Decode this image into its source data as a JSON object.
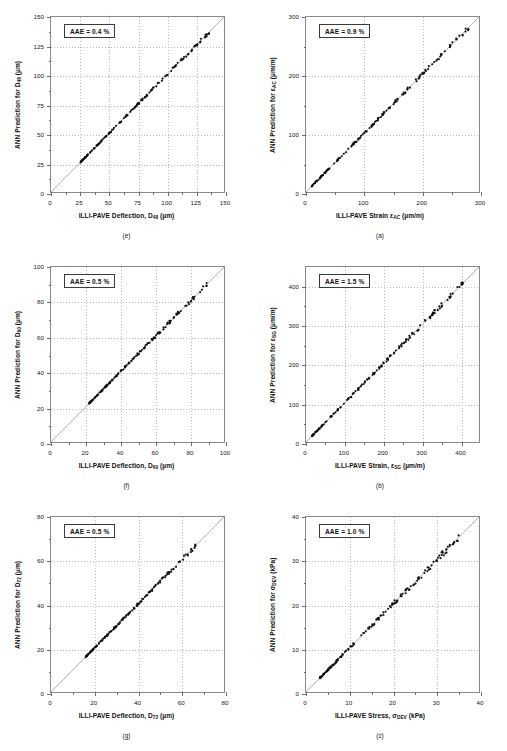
{
  "figure": {
    "background": "#ffffff",
    "point_color": "#111111",
    "grid_color": "#bdbdbd",
    "frame_color": "#8a8a8a"
  },
  "chart_data": [
    {
      "id": "panel-e",
      "type": "scatter",
      "caption": "(e)",
      "annotation": "AAE = 0.4 %",
      "xlabel_html": "ILLI-PAVE Deflection, D<sub>48</sub> (µm)",
      "ylabel_html": "ANN Prediction for D<sub>48</sub> (µm)",
      "xlabel": "ILLI-PAVE Deflection, D48 (µm)",
      "ylabel": "ANN Prediction for D48 (µm)",
      "xlim": [
        0,
        150
      ],
      "ylim": [
        0,
        150
      ],
      "xticks": [
        0,
        25,
        50,
        75,
        100,
        125,
        150
      ],
      "yticks": [
        0,
        25,
        50,
        75,
        100,
        125,
        150
      ],
      "grid": true,
      "identity_line": true,
      "data_range": [
        25,
        138
      ],
      "n_points": 160,
      "spread": 0.9
    },
    {
      "id": "panel-a",
      "type": "scatter",
      "caption": "(a)",
      "annotation": "AAE = 0.9 %",
      "xlabel_html": "ILLI-PAVE Strain ε<sub>AC</sub> (µm/m)",
      "ylabel_html": "ANN Prediction for ε<sub>AC</sub> (µm/m)",
      "xlabel": "ILLI-PAVE Strain εAC (µm/m)",
      "ylabel": "ANN Prediction for εAC (µm/m)",
      "xlim": [
        0,
        300
      ],
      "ylim": [
        0,
        300
      ],
      "xticks": [
        0,
        100,
        200,
        300
      ],
      "yticks": [
        0,
        100,
        200,
        300
      ],
      "grid": true,
      "identity_line": true,
      "data_range": [
        10,
        285
      ],
      "n_points": 160,
      "spread": 2.2
    },
    {
      "id": "panel-f",
      "type": "scatter",
      "caption": "(f)",
      "annotation": "AAE = 0.5 %",
      "xlabel_html": "ILLI-PAVE Deflection, D<sub>60</sub> (µm)",
      "ylabel_html": "ANN Prediction for D<sub>60</sub> (µm)",
      "xlabel": "ILLI-PAVE Deflection, D60 (µm)",
      "ylabel": "ANN Prediction for D60 (µm)",
      "xlim": [
        0,
        100
      ],
      "ylim": [
        0,
        100
      ],
      "xticks": [
        0,
        20,
        40,
        60,
        80,
        100
      ],
      "yticks": [
        0,
        20,
        40,
        60,
        80,
        100
      ],
      "grid": true,
      "identity_line": true,
      "data_range": [
        22,
        90
      ],
      "n_points": 160,
      "spread": 0.7
    },
    {
      "id": "panel-b",
      "type": "scatter",
      "caption": "(b)",
      "annotation": "AAE = 1.5 %",
      "xlabel_html": "ILLI-PAVE Strain, ε<sub>SG</sub> (µm/m)",
      "ylabel_html": "ANN Prediction for ε<sub>SG</sub> (µm/m)",
      "xlabel": "ILLI-PAVE Strain, εSG (µm/m)",
      "ylabel": "ANN Prediction for εSG (µm/m)",
      "xlim": [
        0,
        450
      ],
      "ylim": [
        0,
        450
      ],
      "xticks": [
        0,
        100,
        200,
        300,
        400
      ],
      "yticks": [
        0,
        100,
        200,
        300,
        400
      ],
      "grid": true,
      "identity_line": true,
      "data_range": [
        15,
        410
      ],
      "n_points": 160,
      "spread": 3.6
    },
    {
      "id": "panel-g",
      "type": "scatter",
      "caption": "(g)",
      "annotation": "AAE = 0.5 %",
      "xlabel_html": "ILLI-PAVE Deflection, D<sub>72</sub> (µm)",
      "ylabel_html": "ANN Prediction for D<sub>72</sub> (µm)",
      "xlabel": "ILLI-PAVE Deflection, D72 (µm)",
      "ylabel": "ANN Prediction for D72 (µm)",
      "xlim": [
        0,
        80
      ],
      "ylim": [
        0,
        80
      ],
      "xticks": [
        0,
        20,
        40,
        60,
        80
      ],
      "yticks": [
        0,
        20,
        40,
        60,
        80
      ],
      "grid": true,
      "identity_line": true,
      "data_range": [
        16,
        67
      ],
      "n_points": 160,
      "spread": 0.55
    },
    {
      "id": "panel-c",
      "type": "scatter",
      "caption": "(c)",
      "annotation": "AAE = 1.0 %",
      "xlabel_html": "ILLI-PAVE Stress, σ<sub>DEV</sub> (kPa)",
      "ylabel_html": "ANN Prediction for σ<sub>DEV</sub> (kPa)",
      "xlabel": "ILLI-PAVE Stress, σDEV (kPa)",
      "ylabel": "ANN Prediction for σDEV (kPa)",
      "xlim": [
        0,
        40
      ],
      "ylim": [
        0,
        40
      ],
      "xticks": [
        0,
        10,
        20,
        30,
        40
      ],
      "yticks": [
        0,
        10,
        20,
        30,
        40
      ],
      "grid": true,
      "identity_line": true,
      "data_range": [
        3.2,
        36
      ],
      "n_points": 160,
      "spread": 0.45
    }
  ]
}
